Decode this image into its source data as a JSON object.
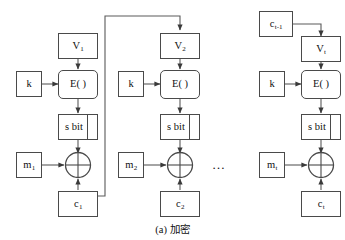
{
  "figure": {
    "caption": "(a) 加密",
    "ellipsis": "…",
    "line_color": "#5a5a5a",
    "box_border_color": "#4a4a4a",
    "text_color": "#111111",
    "background": "#ffffff"
  },
  "stages": [
    {
      "id": "stage-1",
      "iv_label": "V",
      "iv_sub": "1",
      "key_label": "k",
      "cipher_label": "E( )",
      "select_label": "s bit",
      "message_label": "m",
      "message_sub": "1",
      "xor_label": "XOR",
      "output_label": "c",
      "output_sub": "1"
    },
    {
      "id": "stage-2",
      "iv_label": "V",
      "iv_sub": "2",
      "key_label": "k",
      "cipher_label": "E( )",
      "select_label": "s bit",
      "message_label": "m",
      "message_sub": "2",
      "xor_label": "XOR",
      "output_label": "c",
      "output_sub": "2"
    },
    {
      "id": "stage-t",
      "prev_cipher_label": "c",
      "prev_cipher_sub": "t-1",
      "iv_label": "V",
      "iv_sub": "t",
      "key_label": "k",
      "cipher_label": "E( )",
      "select_label": "s bit",
      "message_label": "m",
      "message_sub": "t",
      "xor_label": "XOR",
      "output_label": "c",
      "output_sub": "t"
    }
  ]
}
